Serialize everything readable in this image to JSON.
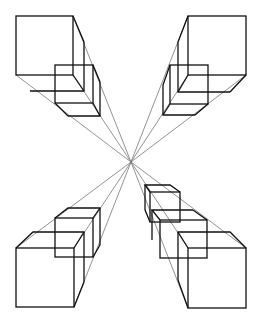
{
  "diagram": {
    "title": "",
    "vanishing_point": [
      131,
      162
    ],
    "stroke_color": "#111111",
    "guide_color": "#777777",
    "groups": [
      {
        "name": "top-left",
        "squares": [
          [
            16,
            16,
            57,
            59
          ],
          [
            27,
            32,
            57,
            59
          ],
          [
            55,
            65,
            38,
            38
          ],
          [
            62,
            78,
            38,
            38
          ]
        ]
      },
      {
        "name": "top-right",
        "squares": [
          [
            188,
            16,
            58,
            59
          ],
          [
            178,
            32,
            58,
            59
          ],
          [
            170,
            65,
            38,
            39
          ],
          [
            163,
            77,
            38,
            38
          ]
        ]
      },
      {
        "name": "bottom-left",
        "squares": [
          [
            16,
            248,
            58,
            59
          ],
          [
            27,
            232,
            57,
            59
          ],
          [
            55,
            218,
            38,
            39
          ],
          [
            62,
            208,
            38,
            38
          ]
        ]
      },
      {
        "name": "bottom-right",
        "squares": [
          [
            188,
            248,
            58,
            60
          ],
          [
            178,
            232,
            58,
            60
          ],
          [
            160,
            220,
            47,
            38
          ],
          [
            150,
            192,
            30,
            30
          ],
          [
            162,
            210,
            38,
            38
          ]
        ]
      }
    ]
  }
}
